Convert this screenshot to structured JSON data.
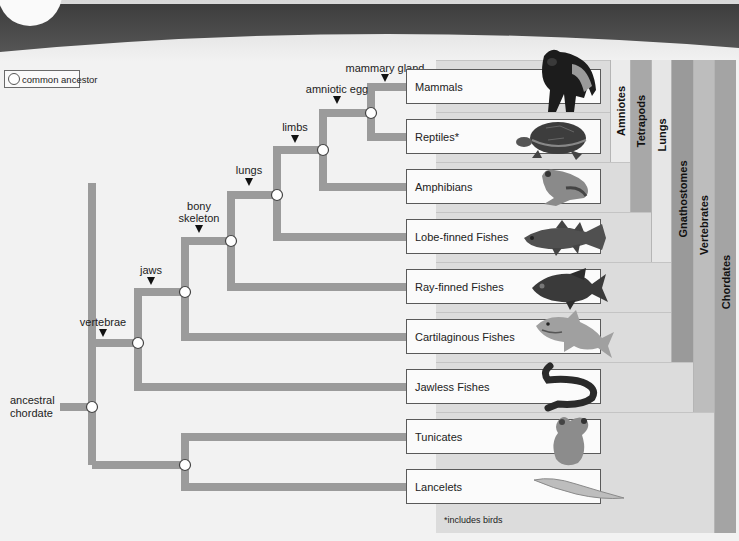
{
  "legend": {
    "label": "common ancestor"
  },
  "root": {
    "label_line1": "ancestral",
    "label_line2": "chordate"
  },
  "traits": [
    {
      "id": "vertebrae",
      "label": "vertebrae"
    },
    {
      "id": "jaws",
      "label": "jaws"
    },
    {
      "id": "bony_skeleton",
      "label_line1": "bony",
      "label_line2": "skeleton"
    },
    {
      "id": "lungs",
      "label": "lungs"
    },
    {
      "id": "limbs",
      "label": "limbs"
    },
    {
      "id": "amniotic_egg",
      "label": "amniotic egg"
    },
    {
      "id": "mammary_gland",
      "label": "mammary gland"
    }
  ],
  "taxa": [
    {
      "label": "Mammals",
      "animal": "gorilla"
    },
    {
      "label": "Reptiles*",
      "animal": "turtle"
    },
    {
      "label": "Amphibians",
      "animal": "frog"
    },
    {
      "label": "Lobe-finned Fishes",
      "animal": "coelacanth"
    },
    {
      "label": "Ray-finned Fishes",
      "animal": "ray-finned-fish"
    },
    {
      "label": "Cartilaginous Fishes",
      "animal": "shark"
    },
    {
      "label": "Jawless Fishes",
      "animal": "lamprey"
    },
    {
      "label": "Tunicates",
      "animal": "tunicate"
    },
    {
      "label": "Lancelets",
      "animal": "lancelet"
    }
  ],
  "clades": [
    {
      "label": "Amniotes",
      "color": "#ebebeb"
    },
    {
      "label": "Tetrapods",
      "color": "#a8a8a8"
    },
    {
      "label": "Lungs",
      "color": "#e6e6e6"
    },
    {
      "label": "Gnathostomes",
      "color": "#9a9a9a"
    },
    {
      "label": "Vertebrates",
      "color": "#bdbdbd"
    },
    {
      "label": "Chordates",
      "color": "#a4a4a4"
    }
  ],
  "footnote": "*includes birds",
  "colors": {
    "branch": "#9b9b9b",
    "banner": "#4a4a4a",
    "panel": "#dcdcdc",
    "node_fill": "#ffffff"
  }
}
